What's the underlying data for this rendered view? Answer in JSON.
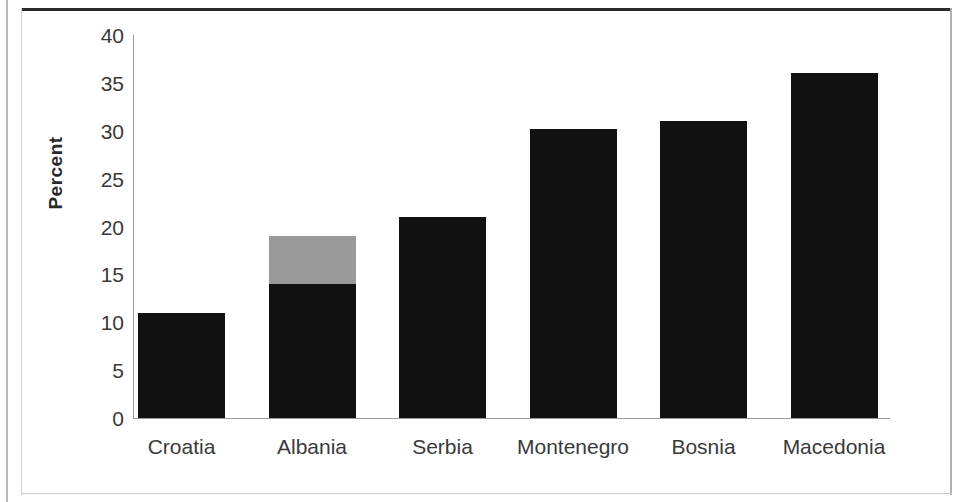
{
  "chart_data": {
    "type": "bar",
    "title": "",
    "subtitle": "",
    "xlabel": "",
    "ylabel": "Percent",
    "categories": [
      "Croatia",
      "Albania",
      "Serbia",
      "Montenegro",
      "Bosnia",
      "Macedonia"
    ],
    "values": [
      11,
      19,
      21,
      30.2,
      31,
      36
    ],
    "stacked": true,
    "grid": false,
    "legend": "none",
    "ylim": [
      0,
      40
    ],
    "y_ticks": [
      0,
      5,
      10,
      15,
      20,
      25,
      30,
      35,
      40
    ],
    "y_tick_labels": [
      "0",
      "5",
      "10",
      "15",
      "20",
      "25",
      "30",
      "35",
      "40"
    ],
    "series": [
      {
        "name": "lower-segment",
        "color": "#111111",
        "values": [
          11,
          14,
          21,
          30.2,
          31,
          36
        ]
      },
      {
        "name": "upper-segment",
        "color": "#9a9a9a",
        "values": [
          0,
          5,
          0,
          0,
          0,
          0
        ]
      }
    ],
    "colors": {
      "primary": "#111111",
      "secondary": "#9a9a9a",
      "axis": "#9a9a9a",
      "text": "#3a3a3a",
      "background": "#ffffff"
    }
  }
}
